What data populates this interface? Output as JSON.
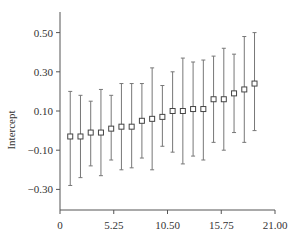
{
  "chart_data": {
    "type": "scatter",
    "subtype": "errorbar",
    "title": "",
    "xlabel": "",
    "ylabel": "Intercept",
    "xlim": [
      0,
      21.0
    ],
    "ylim": [
      -0.4,
      0.6
    ],
    "x_ticks": [
      0,
      5.25,
      10.5,
      15.75,
      21.0
    ],
    "x_tick_labels": [
      "0",
      "5.25",
      "10.50",
      "15.75",
      "21.00"
    ],
    "y_ticks": [
      0.5,
      0.3,
      0.1,
      -0.1,
      -0.3
    ],
    "y_tick_labels": [
      "0.50",
      "0.30",
      "0.10",
      "−0.10",
      "−0.30"
    ],
    "grid": false,
    "legend": null,
    "marker": "open-square",
    "series": [
      {
        "name": "Intercept",
        "x": [
          1,
          2,
          3,
          4,
          5,
          6,
          7,
          8,
          9,
          10,
          11,
          12,
          13,
          14,
          15,
          16,
          17,
          18,
          19
        ],
        "y": [
          -0.03,
          -0.03,
          -0.01,
          -0.01,
          0.01,
          0.02,
          0.02,
          0.05,
          0.06,
          0.07,
          0.1,
          0.1,
          0.11,
          0.11,
          0.16,
          0.16,
          0.19,
          0.21,
          0.24
        ],
        "upper": [
          0.2,
          0.18,
          0.15,
          0.21,
          0.18,
          0.24,
          0.24,
          0.24,
          0.32,
          0.23,
          0.3,
          0.37,
          0.35,
          0.36,
          0.38,
          0.42,
          0.39,
          0.48,
          0.5
        ],
        "lower": [
          -0.28,
          -0.24,
          -0.18,
          -0.23,
          -0.15,
          -0.2,
          -0.19,
          -0.14,
          -0.2,
          -0.08,
          -0.11,
          -0.17,
          -0.13,
          -0.15,
          -0.06,
          -0.1,
          -0.01,
          -0.06,
          0.0
        ]
      }
    ]
  },
  "colors": {
    "axis": "#555555",
    "errorbar": "#777777",
    "marker_stroke": "#444444",
    "marker_fill": "#ffffff",
    "text": "#333333"
  }
}
